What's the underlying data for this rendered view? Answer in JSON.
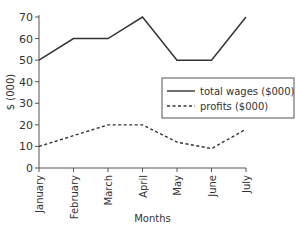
{
  "chart_data": {
    "type": "line",
    "title": "",
    "xlabel": "Months",
    "ylabel": "$ (000)",
    "categories": [
      "January",
      "February",
      "March",
      "April",
      "May",
      "June",
      "July"
    ],
    "ylim": [
      0,
      70
    ],
    "yticks": [
      0,
      10,
      20,
      30,
      40,
      50,
      60,
      70
    ],
    "series": [
      {
        "name": "total wages ($000)",
        "style": "solid",
        "values": [
          50,
          60,
          60,
          70,
          50,
          50,
          70
        ]
      },
      {
        "name": "profits ($000)",
        "style": "dashed",
        "values": [
          10,
          15,
          20,
          20,
          12,
          9,
          18
        ]
      }
    ],
    "legend_position": "right-middle",
    "grid": false
  }
}
